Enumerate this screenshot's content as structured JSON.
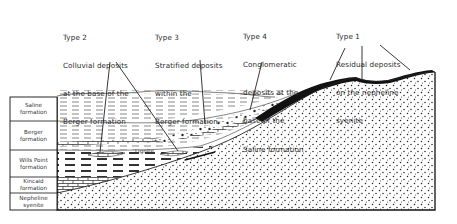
{
  "figure": {
    "type": "geologic cross-section",
    "colors": {
      "ink": "#1a1a1a",
      "paper": "#ffffff",
      "deposit_fill": "#111111"
    }
  },
  "callouts": [
    {
      "id": "type2",
      "lines": [
        "Type 2",
        "Colluvial deposits",
        "at the base of the",
        "Berger formation"
      ]
    },
    {
      "id": "type3",
      "lines": [
        "Type 3",
        "Stratified deposits",
        "within the",
        "Berger formation"
      ]
    },
    {
      "id": "type4",
      "lines": [
        "Type 4",
        "Conglomeratic",
        "deposits at the",
        "base of the",
        "Saline formation"
      ]
    },
    {
      "id": "type1",
      "lines": [
        "Type 1",
        "Residual deposits",
        "on the nepheline",
        "syenite"
      ]
    }
  ],
  "legend": {
    "rows": [
      {
        "label": "Saline\nformation"
      },
      {
        "label": "Berger\nformation"
      },
      {
        "label": "Wills Point\nformation"
      },
      {
        "label": "Kincaid\nformation"
      },
      {
        "label": "Nepheline\nsyenite"
      }
    ]
  },
  "annotations": {
    "lignite": "Lignite"
  }
}
